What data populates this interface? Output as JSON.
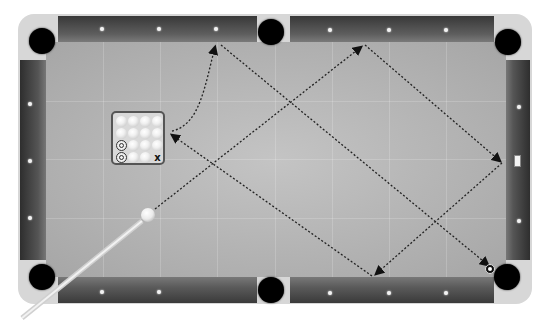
{
  "game": {
    "type": "pool-billiards",
    "table_color": "#b8b8b8",
    "rail_color": "#4a4a4a"
  },
  "rack": {
    "rows": [
      [
        "ball",
        "ball",
        "ball",
        "ball"
      ],
      [
        "ball",
        "ball",
        "ball",
        "ball"
      ],
      [
        "pocketed",
        "ball",
        "ball",
        "ball"
      ],
      [
        "pocketed",
        "ball",
        "ball",
        "x"
      ]
    ],
    "x_label": "x"
  },
  "shot_path": {
    "points": [
      [
        148,
        215
      ],
      [
        363,
        45
      ],
      [
        502,
        162
      ],
      [
        374,
        276
      ],
      [
        170,
        133
      ]
    ],
    "curve_to": [
      216,
      44
    ],
    "secondary_line": [
      [
        220,
        45
      ],
      [
        490,
        268
      ]
    ]
  },
  "pockets": [
    "top-left",
    "top-middle",
    "top-right",
    "bottom-left",
    "bottom-middle",
    "bottom-right"
  ]
}
